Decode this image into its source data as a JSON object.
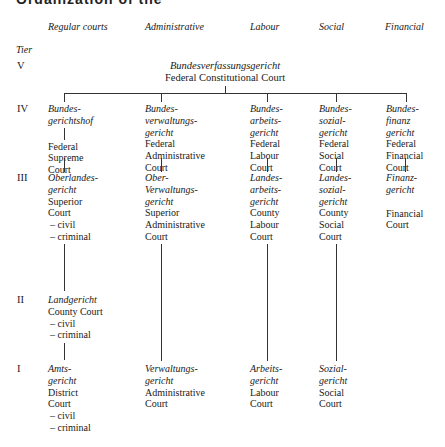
{
  "heading": {
    "text": "Organization of the judiciary"
  },
  "columns": [
    {
      "key": "regular",
      "label": "Regular courts"
    },
    {
      "key": "administrative",
      "label": "Administrative"
    },
    {
      "key": "labour",
      "label": "Labour"
    },
    {
      "key": "social",
      "label": "Social"
    },
    {
      "key": "financial",
      "label": "Financial"
    }
  ],
  "tier_label": "Tier",
  "tiers": [
    "V",
    "IV",
    "III",
    "II",
    "I"
  ],
  "tier_v": {
    "german": "Bundesverfassungsgericht",
    "english": "Federal Constitutional Court"
  },
  "tier_iv": {
    "regular": {
      "german": [
        "Bundes-",
        "gerichtshof"
      ],
      "english": [
        "Federal",
        "Supreme",
        "Court"
      ]
    },
    "administrative": {
      "german": [
        "Bundes-",
        "verwaltungs-",
        "gericht"
      ],
      "english": [
        "Federal",
        "Administrative",
        "Court"
      ]
    },
    "labour": {
      "german": [
        "Bundes-",
        "arbeits-",
        "gericht"
      ],
      "english": [
        "Federal",
        "Labour",
        "Court"
      ]
    },
    "social": {
      "german": [
        "Bundes-",
        "sozial-",
        "gericht"
      ],
      "english": [
        "Federal",
        "Social",
        "Court"
      ]
    },
    "financial": {
      "german": [
        "Bundes-",
        "finanz",
        "gericht"
      ],
      "english": [
        "Federal",
        "Financial",
        "Court"
      ]
    }
  },
  "tier_iii": {
    "regular": {
      "german": [
        "Oberlandes-",
        "gericht"
      ],
      "english": [
        "Superior",
        "Court"
      ],
      "divisions": [
        "– civil",
        "– criminal"
      ]
    },
    "administrative": {
      "german": [
        "Ober-",
        "Verwaltungs-",
        "gericht"
      ],
      "english": [
        "Superior",
        "Administrative",
        "Court"
      ]
    },
    "labour": {
      "german": [
        "Landes-",
        "arbeits-",
        "gericht"
      ],
      "english": [
        "County",
        "Labour",
        "Court"
      ]
    },
    "social": {
      "german": [
        "Landes-",
        "sozial-",
        "gericht"
      ],
      "english": [
        "County",
        "Social",
        "Court"
      ]
    },
    "financial": {
      "german": [
        "Finanz-",
        "gericht"
      ],
      "english": [
        "Financial",
        "Court"
      ]
    }
  },
  "tier_ii": {
    "regular": {
      "german": [
        "Landgericht"
      ],
      "english": [
        "County Court"
      ],
      "divisions": [
        "– civil",
        "– criminal"
      ]
    }
  },
  "tier_i": {
    "regular": {
      "german": [
        "Amts-",
        "gericht"
      ],
      "english": [
        "District",
        "Court"
      ],
      "divisions": [
        "– civil",
        "– criminal"
      ]
    },
    "administrative": {
      "german": [
        "Verwaltungs-",
        "gericht"
      ],
      "english": [
        "Administrative",
        "Court"
      ]
    },
    "labour": {
      "german": [
        "Arbeits-",
        "gericht"
      ],
      "english": [
        "Labour",
        "Court"
      ]
    },
    "social": {
      "german": [
        "Sozial-",
        "gericht"
      ],
      "english": [
        "Social",
        "Court"
      ]
    }
  }
}
